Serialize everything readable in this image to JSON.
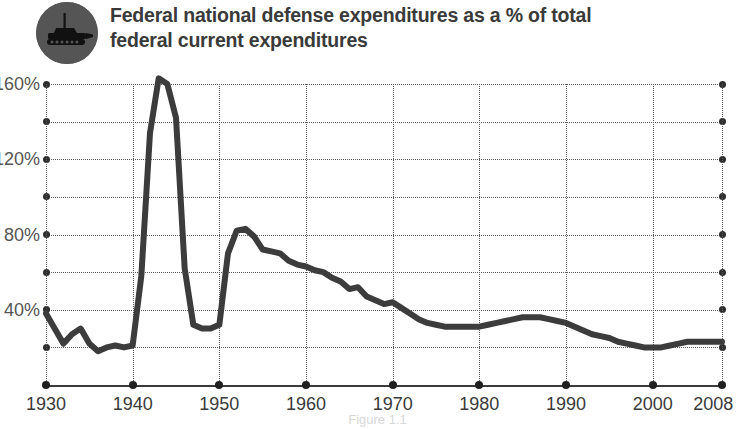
{
  "header": {
    "title_line_1": "Federal national defense expenditures as a % of total",
    "title_line_2": "federal current expenditures",
    "icon": "tank-icon",
    "icon_badge_color": "#555555",
    "title_color": "#3a3a3a"
  },
  "figure": {
    "caption": "Figure 1.1"
  },
  "chart_data": {
    "type": "line",
    "title": "Federal national defense expenditures as a % of total federal current expenditures",
    "xlabel": "",
    "ylabel": "",
    "xlim": [
      1930,
      2008
    ],
    "ylim": [
      0,
      170
    ],
    "grid": true,
    "legend": "none",
    "line_color": "#3c3c3c",
    "line_width": 6,
    "y_ticks_major": [
      40,
      80,
      120,
      160
    ],
    "y_ticks_minor": [
      20,
      60,
      100,
      140
    ],
    "y_tick_labels": [
      "40%",
      "80%",
      "120%",
      "160%"
    ],
    "x_ticks": [
      1930,
      1940,
      1950,
      1960,
      1970,
      1980,
      1990,
      2000,
      2008
    ],
    "x_tick_labels": [
      "1930",
      "1940",
      "1950",
      "1960",
      "1970",
      "1980",
      "1990",
      "2000",
      "2008"
    ],
    "series": [
      {
        "name": "National defense share of federal current expenditures",
        "x": [
          1930,
          1931,
          1932,
          1933,
          1934,
          1935,
          1936,
          1937,
          1938,
          1939,
          1940,
          1941,
          1942,
          1943,
          1944,
          1945,
          1946,
          1947,
          1948,
          1949,
          1950,
          1951,
          1952,
          1953,
          1954,
          1955,
          1956,
          1957,
          1958,
          1959,
          1960,
          1961,
          1962,
          1963,
          1964,
          1965,
          1966,
          1967,
          1968,
          1969,
          1970,
          1971,
          1972,
          1973,
          1974,
          1975,
          1976,
          1977,
          1978,
          1979,
          1980,
          1981,
          1982,
          1983,
          1984,
          1985,
          1986,
          1987,
          1988,
          1989,
          1990,
          1991,
          1992,
          1993,
          1994,
          1995,
          1996,
          1997,
          1998,
          1999,
          2000,
          2001,
          2002,
          2003,
          2004,
          2005,
          2006,
          2007,
          2008
        ],
        "values": [
          38,
          30,
          22,
          27,
          30,
          22,
          18,
          20,
          21,
          20,
          21,
          58,
          134,
          163,
          160,
          142,
          62,
          32,
          30,
          30,
          32,
          70,
          82,
          83,
          79,
          72,
          71,
          70,
          66,
          64,
          63,
          61,
          60,
          57,
          55,
          51,
          52,
          47,
          45,
          43,
          44,
          41,
          38,
          35,
          33,
          32,
          31,
          31,
          31,
          31,
          31,
          32,
          33,
          34,
          35,
          36,
          36,
          36,
          35,
          34,
          33,
          31,
          29,
          27,
          26,
          25,
          23,
          22,
          21,
          20,
          20,
          20,
          21,
          22,
          23,
          23,
          23,
          23,
          23
        ]
      }
    ],
    "annotations": [
      {
        "label": "World War II peak",
        "x": 1943,
        "y": 163
      },
      {
        "label": "Korean War peak",
        "x": 1953,
        "y": 83
      }
    ]
  }
}
